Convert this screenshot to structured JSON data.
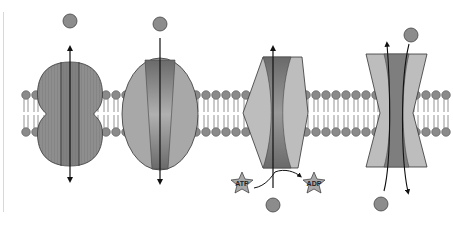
{
  "diagram": {
    "type": "membrane-transport-proteins",
    "membrane": {
      "head_color": "#8a8a8a",
      "tail_color": "#7a7a7a"
    },
    "proteins": [
      {
        "id": "channel",
        "shape": "lobed-oval",
        "direction": "bidirectional",
        "particle_position": "top"
      },
      {
        "id": "carrier",
        "shape": "oval",
        "direction": "inward",
        "particle_position": "top"
      },
      {
        "id": "atp-pump",
        "shape": "hexagon",
        "direction": "outward",
        "particle_position": "bottom"
      },
      {
        "id": "cotransporter",
        "shape": "hourglass",
        "direction": "both",
        "particle_position": "top-and-bottom"
      }
    ],
    "labels": {
      "atp": "ATP",
      "adp": "ADP"
    },
    "colors": {
      "protein_dark": "#6f6f6f",
      "protein_mid": "#8e8e8e",
      "protein_light": "#bdbdbd",
      "particle": "#8c8c8c",
      "arrow": "#111111"
    }
  }
}
